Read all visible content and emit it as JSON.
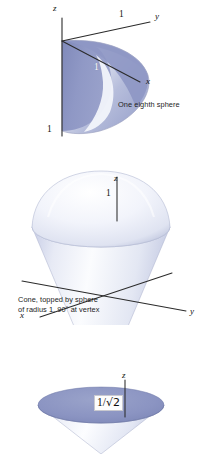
{
  "page": {
    "background_color": "#ffffff",
    "figure_count": 3
  },
  "palette": {
    "sphere_blue": "#8b94c2",
    "sphere_blue_dark": "#6d78ab",
    "sphere_blue_light": "#b9bfd9",
    "cone_light": "#eef0f7",
    "cone_mid": "#dadff0",
    "highlight_white": "#fbfcff",
    "axis_line": "#2a2a2a",
    "caption_text": "#232323"
  },
  "figures": [
    {
      "id": "one-eighth-sphere",
      "caption": "One eighth sphere",
      "axes": [
        {
          "name": "z-axis-label",
          "label": "z"
        },
        {
          "name": "y-axis-label",
          "label": "y"
        },
        {
          "name": "x-axis-label",
          "label": "x"
        }
      ],
      "tick_labels": [
        {
          "name": "y-axis-tick-one",
          "label": "1"
        },
        {
          "name": "x-axis-tick-one",
          "label": "1"
        },
        {
          "name": "z-axis-tick-one",
          "label": "1"
        }
      ]
    },
    {
      "id": "cone-topped-by-sphere",
      "caption_line_1": "Cone, topped by sphere",
      "caption_line_2": "of radius 1, 90° at vertex",
      "axes": [
        {
          "name": "z-axis-label",
          "label": "z"
        },
        {
          "name": "y-axis-label",
          "label": "y"
        },
        {
          "name": "x-axis-label",
          "label": "x"
        }
      ],
      "tick_labels": [
        {
          "name": "z-axis-tick-one",
          "label": "1"
        }
      ]
    },
    {
      "id": "cone-with-disk",
      "caption": "",
      "axes": [
        {
          "name": "z-axis-label",
          "label": "z"
        }
      ],
      "tick_labels": [
        {
          "name": "disk-radius-label",
          "label": "1/√2",
          "numerator": "1",
          "denominator": "√2",
          "separator": "/"
        }
      ]
    }
  ]
}
